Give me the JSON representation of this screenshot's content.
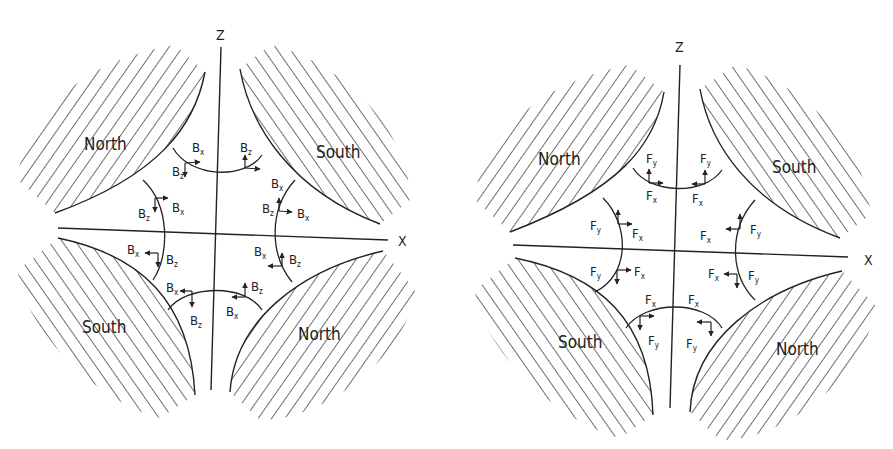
{
  "diagrams": [
    {
      "id": "magnetic-field",
      "axes": {
        "vertical": "Z",
        "horizontal": "X"
      },
      "poles": {
        "top_left": "North",
        "top_right": "South",
        "bottom_left": "South",
        "bottom_right": "North"
      },
      "vector_symbol": "B",
      "components": [
        "x",
        "z"
      ]
    },
    {
      "id": "force",
      "axes": {
        "vertical": "Z",
        "horizontal": "X"
      },
      "poles": {
        "top_left": "North",
        "top_right": "South",
        "bottom_left": "South",
        "bottom_right": "North"
      },
      "vector_symbol": "F",
      "components": [
        "x",
        "y"
      ]
    }
  ]
}
